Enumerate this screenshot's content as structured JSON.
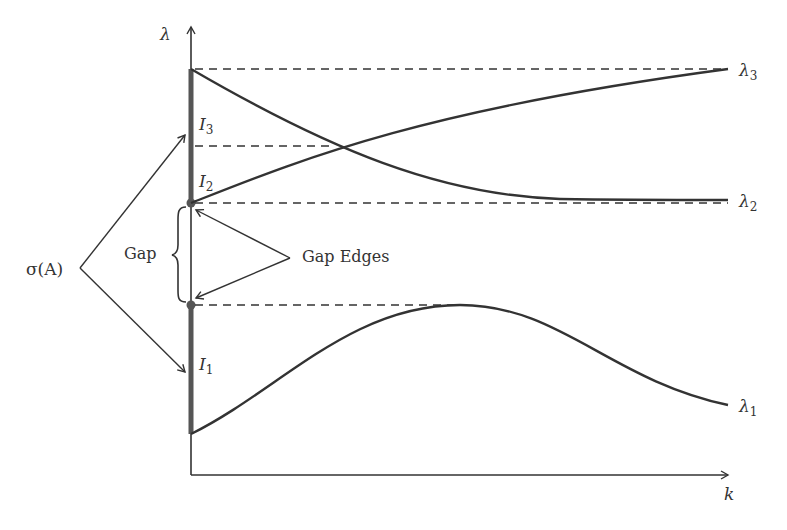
{
  "diagram": {
    "axes": {
      "y_label": "λ",
      "x_label": "k"
    },
    "curves": [
      {
        "name": "λ",
        "subscript": "1",
        "shape": "rises from bottom of I1, peaks at lower gap edge, then decreases"
      },
      {
        "name": "λ",
        "subscript": "2",
        "shape": "decreases from top of I3 to upper gap edge level"
      },
      {
        "name": "λ",
        "subscript": "3",
        "shape": "increases from upper gap edge to top of I3 level"
      }
    ],
    "intervals": [
      {
        "name": "I",
        "subscript": "3"
      },
      {
        "name": "I",
        "subscript": "2"
      },
      {
        "name": "I",
        "subscript": "1"
      }
    ],
    "annotations": {
      "spectrum": "σ(A)",
      "gap": "Gap",
      "gap_edges": "Gap Edges"
    },
    "colors": {
      "line": "#333333",
      "axis_band": "#555555",
      "background": "#ffffff"
    }
  }
}
